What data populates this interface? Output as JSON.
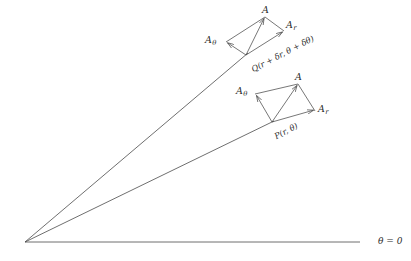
{
  "figure": {
    "type": "polar-vector-decomposition-diagram",
    "width": 411,
    "height": 261,
    "background": "#ffffff",
    "stroke_color": "#4a4a4a",
    "text_color": "#2b2b2b"
  },
  "axis": {
    "label": "θ = 0",
    "name": "theta-zero-axis",
    "origin": {
      "x": 25,
      "y": 242
    },
    "end": {
      "x": 360,
      "y": 242
    }
  },
  "rays": [
    {
      "name": "ray-to-Q",
      "from": {
        "x": 25,
        "y": 242
      },
      "to": {
        "x": 246,
        "y": 55
      },
      "label": "outer radial ray through Q"
    },
    {
      "name": "ray-to-P",
      "from": {
        "x": 25,
        "y": 242
      },
      "to": {
        "x": 272,
        "y": 122
      },
      "label": "inner radial ray through P"
    }
  ],
  "points": [
    {
      "id": "Q",
      "label": "Q(r + δr, θ + δθ)",
      "x": 246,
      "y": 55,
      "label_x": 250,
      "label_y": 60
    },
    {
      "id": "P",
      "label": "P(r, θ)",
      "x": 272,
      "y": 122,
      "label_x": 274,
      "label_y": 127
    }
  ],
  "vector_groups": [
    {
      "name": "vector-parallelogram-at-Q",
      "origin": {
        "x": 246,
        "y": 55
      },
      "resultant": {
        "x": 265,
        "y": 17
      },
      "component_theta": {
        "x": 226,
        "y": 42
      },
      "component_r": {
        "x": 284,
        "y": 31
      },
      "labels": {
        "resultant": "A",
        "resultant_x": 262,
        "resultant_y": 5,
        "theta": "A",
        "theta_sub": "θ",
        "theta_x": 205,
        "theta_y": 35,
        "r": "A",
        "r_sub": "r",
        "r_x": 286,
        "r_y": 20
      }
    },
    {
      "name": "vector-parallelogram-at-P",
      "origin": {
        "x": 272,
        "y": 122
      },
      "resultant": {
        "x": 298,
        "y": 84
      },
      "component_theta": {
        "x": 255,
        "y": 94
      },
      "component_r": {
        "x": 315,
        "y": 111
      },
      "labels": {
        "resultant": "A",
        "resultant_x": 295,
        "resultant_y": 72,
        "theta": "A",
        "theta_sub": "θ",
        "theta_x": 236,
        "theta_y": 86,
        "r": "A",
        "r_sub": "r",
        "r_x": 318,
        "r_y": 104
      }
    }
  ]
}
